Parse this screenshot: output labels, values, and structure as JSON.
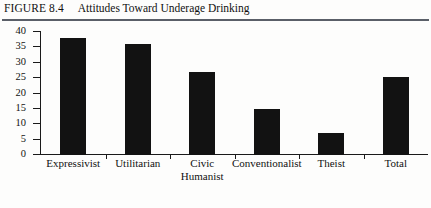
{
  "figure": {
    "number": "FIGURE 8.4",
    "title": "Attitudes Toward Underage Drinking"
  },
  "chart_data": {
    "type": "bar",
    "title": "Attitudes Toward Underage Drinking",
    "xlabel": "",
    "ylabel": "",
    "ylim": [
      0,
      40
    ],
    "yticks": [
      "0",
      "5",
      "10",
      "15",
      "20",
      "25",
      "30",
      "35",
      "40"
    ],
    "grid": false,
    "legend": null,
    "bar_color": "#121212",
    "categories": [
      "Expressivist",
      "Utilitarian",
      "Civic Humanist",
      "Conventionalist",
      "Theist",
      "Total"
    ],
    "category_lines": [
      [
        "Expressivist"
      ],
      [
        "Utilitarian"
      ],
      [
        "Civic",
        "Humanist"
      ],
      [
        "Conventionalist"
      ],
      [
        "Theist"
      ],
      [
        "Total"
      ]
    ],
    "values": [
      38,
      36,
      27,
      15,
      7,
      25.5
    ]
  }
}
